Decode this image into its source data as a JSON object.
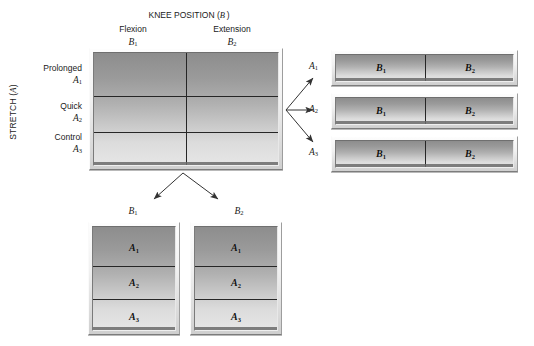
{
  "figure": {
    "column_axis_title": "KNEE POSITION (B)",
    "row_axis_title": "STRETCH (A)"
  },
  "column_headers": [
    {
      "name": "Flexion",
      "code": "B",
      "sub": "1"
    },
    {
      "name": "Extension",
      "code": "B",
      "sub": "2"
    }
  ],
  "row_headers": [
    {
      "name": "Prolonged",
      "code": "A",
      "sub": "1"
    },
    {
      "name": "Quick",
      "code": "A",
      "sub": "2"
    },
    {
      "name": "Control",
      "code": "A",
      "sub": "3"
    }
  ],
  "main_matrix": {
    "name": "factorial-design-matrix",
    "rows": 3,
    "cols": 2
  },
  "row_panels": [
    {
      "label_code": "A",
      "label_sub": "1",
      "cells": [
        {
          "code": "B",
          "sub": "1"
        },
        {
          "code": "B",
          "sub": "2"
        }
      ]
    },
    {
      "label_code": "A",
      "label_sub": "2",
      "cells": [
        {
          "code": "B",
          "sub": "1"
        },
        {
          "code": "B",
          "sub": "2"
        }
      ]
    },
    {
      "label_code": "A",
      "label_sub": "3",
      "cells": [
        {
          "code": "B",
          "sub": "1"
        },
        {
          "code": "B",
          "sub": "2"
        }
      ]
    }
  ],
  "column_panels": [
    {
      "label_code": "B",
      "label_sub": "1",
      "cells": [
        {
          "code": "A",
          "sub": "1"
        },
        {
          "code": "A",
          "sub": "2"
        },
        {
          "code": "A",
          "sub": "3"
        }
      ]
    },
    {
      "label_code": "B",
      "label_sub": "2",
      "cells": [
        {
          "code": "A",
          "sub": "1"
        },
        {
          "code": "A",
          "sub": "2"
        },
        {
          "code": "A",
          "sub": "3"
        }
      ]
    }
  ],
  "colors": {
    "ink": "#1a1a1a",
    "rule": "#262626",
    "plate_frame_light": "#fdfdfd",
    "plate_frame_dark": "#7c7c7c",
    "cell_gradient_top": "#8d8d8d",
    "cell_gradient_bottom": "#e6e6e6",
    "arrow": "#333333"
  },
  "arrows": {
    "to_row_panels_count": 3,
    "to_column_panels_count": 2
  }
}
